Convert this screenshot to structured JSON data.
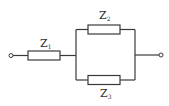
{
  "diagram": {
    "type": "circuit",
    "components": [
      {
        "id": "Z1",
        "label_main": "Z",
        "label_sub": "1",
        "position": "series"
      },
      {
        "id": "Z2",
        "label_main": "Z",
        "label_sub": "2",
        "position": "parallel-top"
      },
      {
        "id": "Z3",
        "label_main": "Z",
        "label_sub": "3",
        "position": "parallel-bottom"
      }
    ],
    "terminals": [
      {
        "id": "left-terminal"
      },
      {
        "id": "right-terminal"
      }
    ],
    "colors": {
      "line": "#3a3a3a",
      "background": "#ffffff"
    }
  }
}
